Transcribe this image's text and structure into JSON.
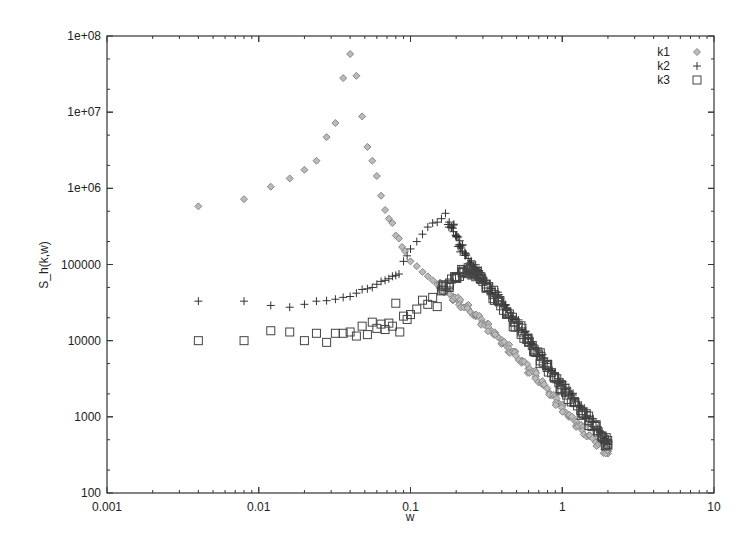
{
  "chart_data": {
    "type": "scatter",
    "title": "",
    "xlabel": "w",
    "ylabel": "S_h(k,w)",
    "xscale": "log",
    "yscale": "log",
    "xlim": [
      0.001,
      10
    ],
    "ylim": [
      100,
      100000000
    ],
    "grid": false,
    "legend_position": "top-right",
    "x_ticks": [
      "0.001",
      "0.01",
      "0.1",
      "1",
      "10"
    ],
    "y_ticks": [
      "100",
      "1000",
      "10000",
      "100000",
      "1e+06",
      "1e+07",
      "1e+08"
    ],
    "series": [
      {
        "name": "k1",
        "marker": "diamond",
        "color": "#888888",
        "points": [
          [
            0.004,
            580000
          ],
          [
            0.008,
            720000
          ],
          [
            0.012,
            1050000
          ],
          [
            0.016,
            1350000
          ],
          [
            0.02,
            1750000
          ],
          [
            0.024,
            2300000
          ],
          [
            0.028,
            4700000
          ],
          [
            0.032,
            7200000
          ],
          [
            0.036,
            28000000
          ],
          [
            0.04,
            58000000
          ],
          [
            0.044,
            30000000
          ],
          [
            0.048,
            8800000
          ],
          [
            0.052,
            3500000
          ],
          [
            0.056,
            2300000
          ],
          [
            0.06,
            1450000
          ],
          [
            0.064,
            800000
          ],
          [
            0.068,
            520000
          ],
          [
            0.072,
            400000
          ],
          [
            0.076,
            350000
          ],
          [
            0.08,
            240000
          ],
          [
            0.084,
            220000
          ],
          [
            0.088,
            170000
          ],
          [
            0.092,
            150000
          ],
          [
            0.1,
            110000
          ],
          [
            0.11,
            95000
          ],
          [
            0.12,
            80000
          ],
          [
            0.13,
            70000
          ],
          [
            0.14,
            62000
          ],
          [
            0.15,
            55000
          ],
          [
            0.17,
            45000
          ],
          [
            0.19,
            38000
          ],
          [
            0.21,
            32000
          ],
          [
            0.24,
            26000
          ],
          [
            0.27,
            21000
          ],
          [
            0.3,
            17000
          ],
          [
            0.34,
            13500
          ],
          [
            0.38,
            11000
          ],
          [
            0.43,
            8500
          ],
          [
            0.48,
            7000
          ],
          [
            0.54,
            5500
          ],
          [
            0.6,
            4300
          ],
          [
            0.67,
            3400
          ],
          [
            0.75,
            2600
          ],
          [
            0.85,
            1900
          ],
          [
            0.95,
            1500
          ],
          [
            1.05,
            1150
          ],
          [
            1.2,
            900
          ],
          [
            1.35,
            700
          ],
          [
            1.5,
            560
          ],
          [
            1.7,
            450
          ],
          [
            1.9,
            370
          ],
          [
            2.0,
            330
          ]
        ]
      },
      {
        "name": "k2",
        "marker": "plus",
        "color": "#333333",
        "points": [
          [
            0.004,
            33000
          ],
          [
            0.008,
            33000
          ],
          [
            0.012,
            29000
          ],
          [
            0.016,
            27500
          ],
          [
            0.02,
            30000
          ],
          [
            0.024,
            33000
          ],
          [
            0.028,
            33500
          ],
          [
            0.032,
            35000
          ],
          [
            0.036,
            37000
          ],
          [
            0.04,
            38000
          ],
          [
            0.044,
            42000
          ],
          [
            0.048,
            47000
          ],
          [
            0.052,
            48000
          ],
          [
            0.056,
            50000
          ],
          [
            0.06,
            55000
          ],
          [
            0.064,
            60000
          ],
          [
            0.068,
            62000
          ],
          [
            0.072,
            65000
          ],
          [
            0.076,
            70000
          ],
          [
            0.08,
            72000
          ],
          [
            0.084,
            75000
          ],
          [
            0.09,
            110000
          ],
          [
            0.095,
            130000
          ],
          [
            0.1,
            160000
          ],
          [
            0.11,
            200000
          ],
          [
            0.12,
            250000
          ],
          [
            0.13,
            310000
          ],
          [
            0.14,
            350000
          ],
          [
            0.15,
            360000
          ],
          [
            0.16,
            400000
          ],
          [
            0.17,
            470000
          ],
          [
            0.18,
            360000
          ],
          [
            0.19,
            300000
          ],
          [
            0.2,
            230000
          ],
          [
            0.21,
            180000
          ],
          [
            0.22,
            150000
          ],
          [
            0.24,
            120000
          ],
          [
            0.26,
            95000
          ],
          [
            0.28,
            80000
          ],
          [
            0.3,
            65000
          ],
          [
            0.34,
            48000
          ],
          [
            0.38,
            36000
          ],
          [
            0.43,
            26000
          ],
          [
            0.48,
            19000
          ],
          [
            0.54,
            14000
          ],
          [
            0.6,
            10500
          ],
          [
            0.67,
            7800
          ],
          [
            0.75,
            5800
          ],
          [
            0.85,
            4000
          ],
          [
            0.95,
            3000
          ],
          [
            1.05,
            2300
          ],
          [
            1.2,
            1700
          ],
          [
            1.35,
            1250
          ],
          [
            1.5,
            950
          ],
          [
            1.7,
            700
          ],
          [
            1.9,
            520
          ],
          [
            2.0,
            450
          ]
        ]
      },
      {
        "name": "k3",
        "marker": "square",
        "color": "#444444",
        "points": [
          [
            0.004,
            10000
          ],
          [
            0.008,
            10000
          ],
          [
            0.012,
            13500
          ],
          [
            0.016,
            13000
          ],
          [
            0.02,
            10000
          ],
          [
            0.024,
            12500
          ],
          [
            0.028,
            9500
          ],
          [
            0.032,
            12500
          ],
          [
            0.036,
            12500
          ],
          [
            0.04,
            13000
          ],
          [
            0.044,
            11500
          ],
          [
            0.048,
            15500
          ],
          [
            0.052,
            12000
          ],
          [
            0.056,
            17500
          ],
          [
            0.06,
            14500
          ],
          [
            0.064,
            16500
          ],
          [
            0.068,
            14000
          ],
          [
            0.072,
            17000
          ],
          [
            0.076,
            15500
          ],
          [
            0.08,
            31000
          ],
          [
            0.085,
            13000
          ],
          [
            0.09,
            21000
          ],
          [
            0.095,
            19000
          ],
          [
            0.1,
            22000
          ],
          [
            0.11,
            26000
          ],
          [
            0.12,
            34000
          ],
          [
            0.13,
            30000
          ],
          [
            0.14,
            37000
          ],
          [
            0.15,
            28000
          ],
          [
            0.16,
            45000
          ],
          [
            0.18,
            55000
          ],
          [
            0.2,
            68000
          ],
          [
            0.22,
            80000
          ],
          [
            0.24,
            85000
          ],
          [
            0.26,
            78000
          ],
          [
            0.28,
            72000
          ],
          [
            0.3,
            60000
          ],
          [
            0.34,
            45000
          ],
          [
            0.38,
            33000
          ],
          [
            0.43,
            24000
          ],
          [
            0.48,
            17500
          ],
          [
            0.54,
            13000
          ],
          [
            0.6,
            9500
          ],
          [
            0.67,
            7000
          ],
          [
            0.75,
            5200
          ],
          [
            0.85,
            3800
          ],
          [
            0.95,
            2800
          ],
          [
            1.05,
            2100
          ],
          [
            1.2,
            1550
          ],
          [
            1.35,
            1150
          ],
          [
            1.5,
            880
          ],
          [
            1.7,
            660
          ],
          [
            1.9,
            500
          ],
          [
            2.0,
            430
          ]
        ]
      }
    ]
  },
  "legend": {
    "items": [
      {
        "label": "k1",
        "marker": "diamond"
      },
      {
        "label": "k2",
        "marker": "plus"
      },
      {
        "label": "k3",
        "marker": "square"
      }
    ]
  },
  "axes": {
    "xlabel": "w",
    "ylabel": "S_h(k,w)"
  }
}
